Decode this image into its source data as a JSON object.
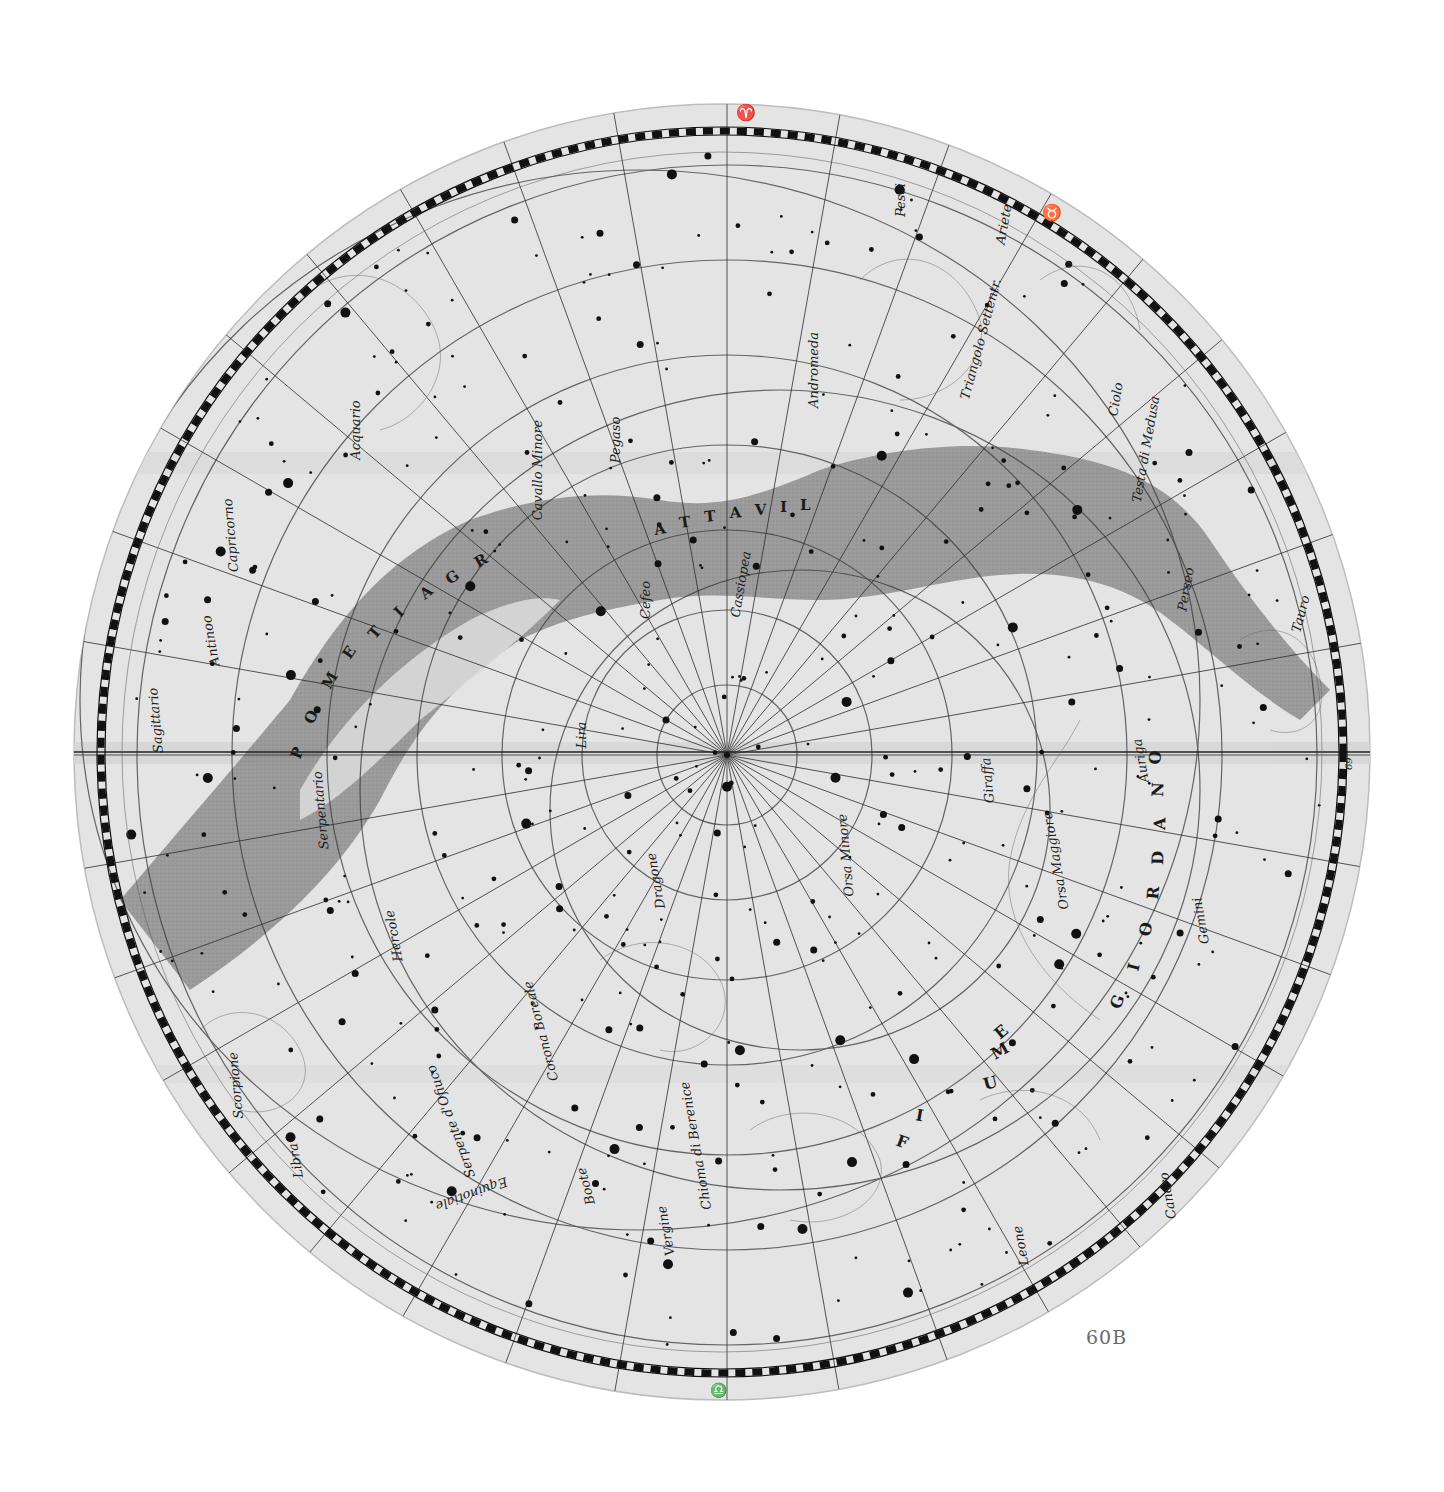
{
  "plate": {
    "number": "60B"
  },
  "map": {
    "type": "celestial planisphere",
    "hemisphere": "northern",
    "center_label": "Polo dell'Eclittica",
    "colors": {
      "paper": "#e6e6e6",
      "milky_way": "#8c8c8c",
      "ink": "#1e1e1e",
      "border_scale": "#111111"
    },
    "zodiac_symbols": {
      "top": "♈",
      "top_right": "♉",
      "bottom": "♎",
      "right_number": "69"
    },
    "milky_way_lettering_left": [
      "P",
      "O",
      "M",
      "E",
      "T",
      "I",
      "A",
      "G",
      "R"
    ],
    "milky_way_lettering_top": [
      "A",
      "T",
      "T",
      "A",
      "V",
      "I",
      "L"
    ],
    "river_lettering": [
      "F",
      "I",
      "U",
      "M",
      "E",
      "G",
      "I",
      "O",
      "R",
      "D",
      "A",
      "N",
      "O"
    ],
    "constellations": [
      {
        "name": "Pesci",
        "x": 905,
        "y": 200,
        "rot": -90
      },
      {
        "name": "Ariete",
        "x": 1008,
        "y": 225,
        "rot": -80
      },
      {
        "name": "Andromeda",
        "x": 818,
        "y": 370,
        "rot": -90
      },
      {
        "name": "Triangolo Settentr.",
        "x": 985,
        "y": 340,
        "rot": -75
      },
      {
        "name": "Ciolo",
        "x": 1120,
        "y": 400,
        "rot": -80
      },
      {
        "name": "Testa di Medusa",
        "x": 1150,
        "y": 450,
        "rot": -80
      },
      {
        "name": "Perseo",
        "x": 1190,
        "y": 590,
        "rot": -80
      },
      {
        "name": "Tauro",
        "x": 1305,
        "y": 615,
        "rot": -75
      },
      {
        "name": "Pegaso",
        "x": 620,
        "y": 440,
        "rot": -90
      },
      {
        "name": "Cavallo Minore",
        "x": 542,
        "y": 470,
        "rot": -90
      },
      {
        "name": "Acquario",
        "x": 360,
        "y": 430,
        "rot": -90
      },
      {
        "name": "Capricorno",
        "x": 235,
        "y": 535,
        "rot": -95
      },
      {
        "name": "Antinoo",
        "x": 215,
        "y": 640,
        "rot": -100
      },
      {
        "name": "Sagittario",
        "x": 160,
        "y": 720,
        "rot": -95
      },
      {
        "name": "Cefeo",
        "x": 650,
        "y": 600,
        "rot": -90
      },
      {
        "name": "Cassiopea",
        "x": 745,
        "y": 585,
        "rot": -80
      },
      {
        "name": "Lira",
        "x": 586,
        "y": 735,
        "rot": -90
      },
      {
        "name": "Serpentario",
        "x": 325,
        "y": 810,
        "rot": -95
      },
      {
        "name": "Dragone",
        "x": 660,
        "y": 880,
        "rot": -100
      },
      {
        "name": "Orsa Minore",
        "x": 850,
        "y": 855,
        "rot": -95
      },
      {
        "name": "Giraffa",
        "x": 992,
        "y": 780,
        "rot": -95
      },
      {
        "name": "Auriga",
        "x": 1145,
        "y": 760,
        "rot": -100
      },
      {
        "name": "Orsa Maggiore",
        "x": 1060,
        "y": 860,
        "rot": -100
      },
      {
        "name": "Gemini",
        "x": 1205,
        "y": 920,
        "rot": -100
      },
      {
        "name": "Hercole",
        "x": 398,
        "y": 935,
        "rot": -100
      },
      {
        "name": "Corona Boreale",
        "x": 545,
        "y": 1030,
        "rot": -105
      },
      {
        "name": "Serpente d'Ofiuco",
        "x": 455,
        "y": 1120,
        "rot": -110
      },
      {
        "name": "Scorpione",
        "x": 240,
        "y": 1085,
        "rot": -95
      },
      {
        "name": "Libra",
        "x": 300,
        "y": 1160,
        "rot": -100
      },
      {
        "name": "Equinotiale",
        "x": 470,
        "y": 1190,
        "rot": 160
      },
      {
        "name": "Chioma di Berenice",
        "x": 700,
        "y": 1145,
        "rot": -100
      },
      {
        "name": "Boote",
        "x": 590,
        "y": 1185,
        "rot": -105
      },
      {
        "name": "Vergine",
        "x": 670,
        "y": 1230,
        "rot": -100
      },
      {
        "name": "Leone",
        "x": 1025,
        "y": 1245,
        "rot": -100
      },
      {
        "name": "Cancro",
        "x": 1172,
        "y": 1195,
        "rot": -100
      }
    ]
  }
}
